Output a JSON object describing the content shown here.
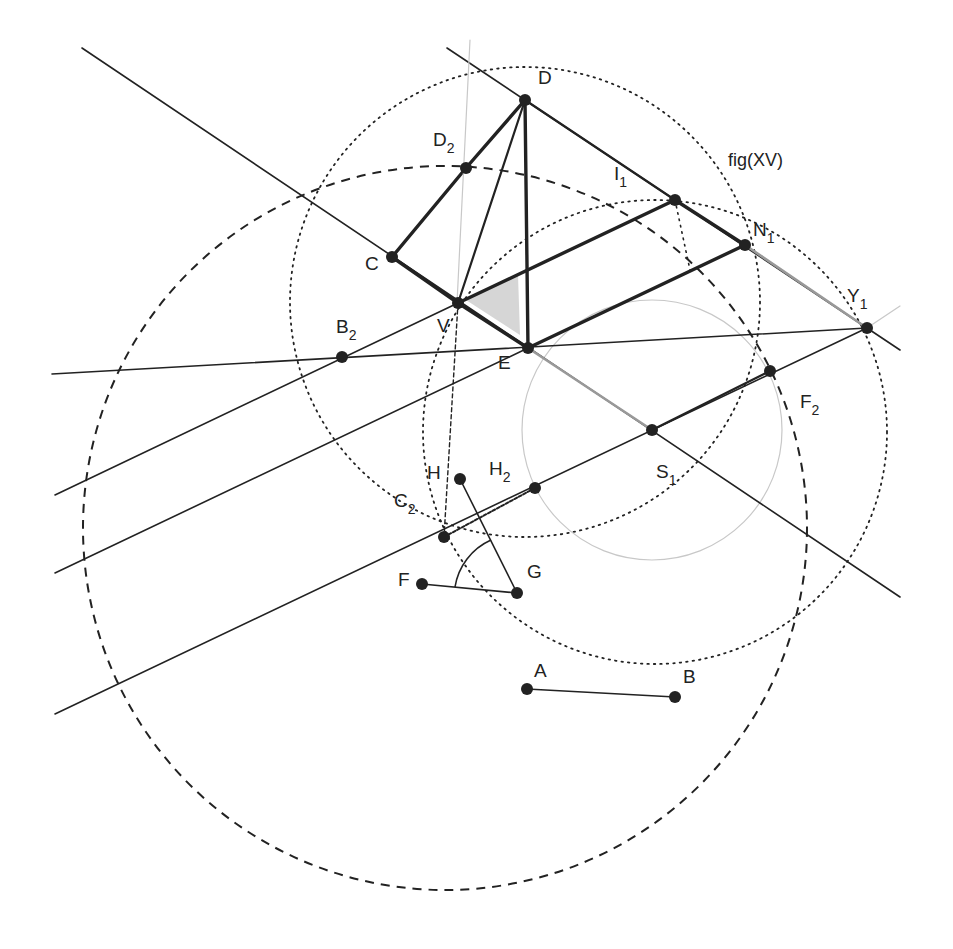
{
  "figure": {
    "title": "fig(XV)",
    "colors": {
      "ink": "#222222",
      "gray_line": "#999999",
      "faint": "#c8c8c8",
      "shade": "#d6d6d6"
    }
  },
  "points": [
    {
      "id": "D",
      "label": "D",
      "sub": "",
      "x": 525,
      "y": 100,
      "lx": 538,
      "ly": 84
    },
    {
      "id": "D2",
      "label": "D",
      "sub": "2",
      "x": 466,
      "y": 168,
      "lx": 433,
      "ly": 146
    },
    {
      "id": "C",
      "label": "C",
      "sub": "",
      "x": 392,
      "y": 257,
      "lx": 365,
      "ly": 270
    },
    {
      "id": "V",
      "label": "V",
      "sub": "",
      "x": 458,
      "y": 303,
      "lx": 437,
      "ly": 332
    },
    {
      "id": "E",
      "label": "E",
      "sub": "",
      "x": 528,
      "y": 348,
      "lx": 498,
      "ly": 369
    },
    {
      "id": "I1",
      "label": "I",
      "sub": "1",
      "x": 675,
      "y": 200,
      "lx": 614,
      "ly": 180
    },
    {
      "id": "N1",
      "label": "N",
      "sub": "1",
      "x": 745,
      "y": 245,
      "lx": 753,
      "ly": 236
    },
    {
      "id": "Y1",
      "label": "Y",
      "sub": "1",
      "x": 867,
      "y": 328,
      "lx": 847,
      "ly": 302
    },
    {
      "id": "B2",
      "label": "B",
      "sub": "2",
      "x": 342,
      "y": 357,
      "lx": 336,
      "ly": 333
    },
    {
      "id": "F2",
      "label": "F",
      "sub": "2",
      "x": 770,
      "y": 371,
      "lx": 800,
      "ly": 408
    },
    {
      "id": "S1",
      "label": "S",
      "sub": "1",
      "x": 652,
      "y": 430,
      "lx": 656,
      "ly": 478
    },
    {
      "id": "H",
      "label": "H",
      "sub": "",
      "x": 460,
      "y": 479,
      "lx": 427,
      "ly": 479
    },
    {
      "id": "H2",
      "label": "H",
      "sub": "2",
      "x": 535,
      "y": 488,
      "lx": 489,
      "ly": 475
    },
    {
      "id": "C2",
      "label": "C",
      "sub": "2",
      "x": 444,
      "y": 537,
      "lx": 394,
      "ly": 507
    },
    {
      "id": "F",
      "label": "F",
      "sub": "",
      "x": 422,
      "y": 584,
      "lx": 398,
      "ly": 586
    },
    {
      "id": "G",
      "label": "G",
      "sub": "",
      "x": 517,
      "y": 593,
      "lx": 527,
      "ly": 578
    },
    {
      "id": "A",
      "label": "A",
      "sub": "",
      "x": 527,
      "y": 689,
      "lx": 534,
      "ly": 677
    },
    {
      "id": "B",
      "label": "B",
      "sub": "",
      "x": 675,
      "y": 697,
      "lx": 683,
      "ly": 683
    }
  ],
  "segments": [
    {
      "name": "line-through-C-V-E-S1",
      "x1": 82,
      "y1": 48,
      "x2": 900,
      "y2": 597,
      "style": "thin"
    },
    {
      "name": "line-through-D-I1-Y1",
      "x1": 447,
      "y1": 48,
      "x2": 900,
      "y2": 350,
      "style": "thin"
    },
    {
      "name": "line-B2-Y1",
      "x1": 52,
      "y1": 374,
      "x2": 867,
      "y2": 328,
      "style": "thin"
    },
    {
      "name": "line-upper-parallel",
      "x1": 55,
      "y1": 495,
      "x2": 458,
      "y2": 303,
      "style": "thin"
    },
    {
      "name": "line-middle-parallel",
      "x1": 55,
      "y1": 573,
      "x2": 528,
      "y2": 348,
      "style": "thin"
    },
    {
      "name": "line-lower-parallel",
      "x1": 55,
      "y1": 714,
      "x2": 867,
      "y2": 328,
      "style": "thin"
    },
    {
      "name": "edge-D-D2",
      "x1": 525,
      "y1": 100,
      "x2": 466,
      "y2": 168,
      "style": "thick"
    },
    {
      "name": "edge-D2-C",
      "x1": 466,
      "y1": 168,
      "x2": 392,
      "y2": 257,
      "style": "thick"
    },
    {
      "name": "edge-C-V",
      "x1": 392,
      "y1": 257,
      "x2": 458,
      "y2": 303,
      "style": "thick"
    },
    {
      "name": "edge-V-E",
      "x1": 458,
      "y1": 303,
      "x2": 528,
      "y2": 348,
      "style": "thick"
    },
    {
      "name": "edge-D-E",
      "x1": 525,
      "y1": 100,
      "x2": 528,
      "y2": 348,
      "style": "thick"
    },
    {
      "name": "edge-D-V",
      "x1": 525,
      "y1": 100,
      "x2": 458,
      "y2": 303,
      "style": "medium"
    },
    {
      "name": "edge-D-I1",
      "x1": 525,
      "y1": 100,
      "x2": 675,
      "y2": 200,
      "style": "medium"
    },
    {
      "name": "edge-V-I1",
      "x1": 458,
      "y1": 303,
      "x2": 675,
      "y2": 200,
      "style": "thick"
    },
    {
      "name": "edge-I1-N1",
      "x1": 675,
      "y1": 200,
      "x2": 745,
      "y2": 245,
      "style": "thick"
    },
    {
      "name": "edge-E-N1",
      "x1": 528,
      "y1": 348,
      "x2": 745,
      "y2": 245,
      "style": "thick"
    },
    {
      "name": "edge-N1-Y1",
      "x1": 745,
      "y1": 245,
      "x2": 867,
      "y2": 328,
      "style": "gray"
    },
    {
      "name": "edge-E-S1",
      "x1": 528,
      "y1": 348,
      "x2": 652,
      "y2": 430,
      "style": "gray"
    },
    {
      "name": "segment-S1-F2",
      "x1": 652,
      "y1": 430,
      "x2": 770,
      "y2": 371,
      "style": "medium"
    },
    {
      "name": "segment-H-G",
      "x1": 460,
      "y1": 479,
      "x2": 517,
      "y2": 593,
      "style": "thin"
    },
    {
      "name": "segment-F-G",
      "x1": 422,
      "y1": 584,
      "x2": 517,
      "y2": 593,
      "style": "thin"
    },
    {
      "name": "segment-A-B",
      "x1": 527,
      "y1": 689,
      "x2": 675,
      "y2": 697,
      "style": "thin"
    },
    {
      "name": "segment-C2-H2",
      "x1": 444,
      "y1": 537,
      "x2": 535,
      "y2": 488,
      "style": "dashdot"
    },
    {
      "name": "vertical-through-D2",
      "x1": 470,
      "y1": 40,
      "x2": 457,
      "y2": 303,
      "style": "faint"
    },
    {
      "name": "vertical-V-C2",
      "x1": 458,
      "y1": 303,
      "x2": 444,
      "y2": 537,
      "style": "dashed-thin"
    },
    {
      "name": "dotted-I1-down",
      "x1": 675,
      "y1": 200,
      "x2": 690,
      "y2": 270,
      "style": "dotted"
    },
    {
      "name": "ext-Y1-right",
      "x1": 867,
      "y1": 328,
      "x2": 900,
      "y2": 306,
      "style": "faint"
    }
  ],
  "circles": [
    {
      "name": "large-dashed-circle",
      "cx": 445,
      "cy": 528,
      "r": 362,
      "style": "dashed"
    },
    {
      "name": "upper-dotted-circle",
      "cx": 525,
      "cy": 302,
      "r": 235,
      "style": "dotted"
    },
    {
      "name": "lower-dotted-circle",
      "cx": 655,
      "cy": 432,
      "r": 232,
      "style": "dotted"
    },
    {
      "name": "faint-circle-S1",
      "cx": 652,
      "cy": 430,
      "r": 130,
      "style": "faint"
    }
  ],
  "arcs": [
    {
      "name": "angle-arc-at-G",
      "d": "M 455 587 A 62 62 0 0 1 491 540",
      "style": "thin"
    }
  ],
  "shaded_angle": {
    "name": "angle-V-E-shade",
    "points": "466,300 518,275 520,335"
  }
}
